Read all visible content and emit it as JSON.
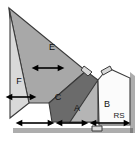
{
  "figure": {
    "canvas": {
      "width": 138,
      "height": 142,
      "background": "#ffffff"
    },
    "regions": [
      {
        "id": "E",
        "label": "E",
        "fill": "#a8a8a8",
        "label_x": 52,
        "label_y": 48,
        "points": "9,8 86,71 49,103 29,103"
      },
      {
        "id": "F",
        "label": "F",
        "fill": "#d9d9d9",
        "label_x": 19,
        "label_y": 82,
        "points": "9,8 29,103 10,118 10,20"
      },
      {
        "id": "C",
        "label": "C",
        "fill": "#6b6b6b",
        "label_x": 58,
        "label_y": 98,
        "points": "49,103 86,71 98,80 98,122 52,122"
      },
      {
        "id": "A",
        "label": "A",
        "fill": "#b5b5b5",
        "label_x": 77,
        "label_y": 109,
        "points": "98,80 98,122 70,122"
      },
      {
        "id": "B",
        "label": "B",
        "fill": "#fbfbfb",
        "label_x": 107,
        "label_y": 105,
        "points": "98,80 108,68 130,78 130,125 99,125"
      }
    ],
    "corner_labels": [
      {
        "id": "RS",
        "text": "RS",
        "x": 119,
        "y": 116
      }
    ],
    "arrows": [
      {
        "id": "arrow-E",
        "x1": 38,
        "y1": 68,
        "x2": 58,
        "y2": 68,
        "region": "E"
      },
      {
        "id": "arrow-F",
        "x1": 12,
        "y1": 97,
        "x2": 30,
        "y2": 97,
        "region": "F"
      },
      {
        "id": "arrow-C",
        "x1": 22,
        "y1": 123,
        "x2": 48,
        "y2": 123,
        "region": "C"
      },
      {
        "id": "arrow-A",
        "x1": 62,
        "y1": 123,
        "x2": 82,
        "y2": 123,
        "region": "A"
      },
      {
        "id": "arrow-B",
        "x1": 96,
        "y1": 123,
        "x2": 124,
        "y2": 123,
        "region": "B"
      }
    ],
    "colors": {
      "region_E": "#a8a8a8",
      "region_F": "#d9d9d9",
      "region_C": "#6b6b6b",
      "region_A": "#b5b5b5",
      "region_B": "#fbfbfb",
      "outline": "#3a3a3a",
      "arrow": "#000000",
      "text": "#111111"
    }
  }
}
